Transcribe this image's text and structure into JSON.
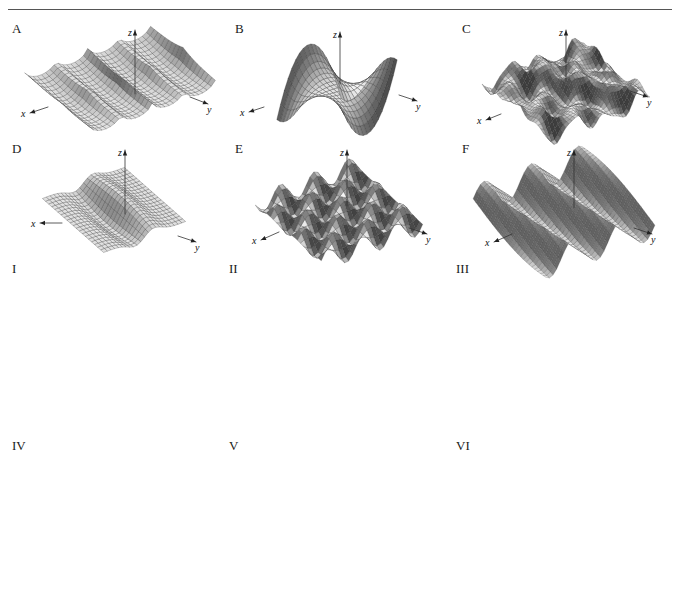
{
  "figure": {
    "title_strip": "",
    "rule": "horizontal-rule",
    "surface_axis_labels": {
      "x": "x",
      "y": "y",
      "z": "z"
    },
    "contour_axis_labels": {
      "x": "x",
      "y": "y"
    }
  },
  "surfaces": [
    {
      "label": "A",
      "name": "surface-a",
      "description": "sharp repeated ridges and cusps running across the domain",
      "kind": "ridges-cusps",
      "axes": [
        "x",
        "y",
        "z"
      ]
    },
    {
      "label": "B",
      "name": "surface-b",
      "description": "monkey saddle with upturned corners and central peak",
      "kind": "monkey-saddle",
      "axes": [
        "x",
        "y",
        "z"
      ]
    },
    {
      "label": "C",
      "name": "surface-c",
      "description": "irregular rippled terrain with many small bumps",
      "kind": "rough-ripples",
      "axes": [
        "x",
        "y",
        "z"
      ]
    },
    {
      "label": "D",
      "name": "surface-d",
      "description": "smooth single S-shaped ridge and trough",
      "kind": "single-ridge-trough",
      "axes": [
        "x",
        "y",
        "z"
      ]
    },
    {
      "label": "E",
      "name": "surface-e",
      "description": "egg-carton lattice of alternating bumps and dips",
      "kind": "egg-carton",
      "axes": [
        "x",
        "y",
        "z"
      ]
    },
    {
      "label": "F",
      "name": "surface-f",
      "description": "parallel sinusoidal waves oriented along one direction",
      "kind": "parallel-waves",
      "axes": [
        "x",
        "y",
        "z"
      ]
    }
  ],
  "contours": [
    {
      "label": "I",
      "name": "contour-i",
      "description": "evenly spaced parallel diagonal level lines",
      "kind": "diagonal-bands",
      "axes": [
        "x",
        "y"
      ]
    },
    {
      "label": "II",
      "name": "contour-ii",
      "description": "hyperbolas asymptotic to the coordinate axes",
      "kind": "hyperbolic-saddle",
      "axes": [
        "x",
        "y"
      ]
    },
    {
      "label": "III",
      "name": "contour-iii",
      "description": "periodic lattice of closed loops around alternating peaks and pits",
      "kind": "periodic-lattice",
      "axes": [
        "x",
        "y"
      ]
    },
    {
      "label": "IV",
      "name": "contour-iv",
      "description": "nested loops stacked periodically in the vertical direction, opening to the left",
      "kind": "stacked-loops",
      "axes": [
        "x",
        "y"
      ]
    },
    {
      "label": "V",
      "name": "contour-v",
      "description": "dipole pattern with two lobes and rays converging at the origin",
      "kind": "dipole-rays",
      "axes": [
        "x",
        "y"
      ]
    },
    {
      "label": "VI",
      "name": "contour-vi",
      "description": "rounded square closed loops repeating in a coarse grid",
      "kind": "rounded-grid-loops",
      "axes": [
        "x",
        "y"
      ]
    }
  ]
}
